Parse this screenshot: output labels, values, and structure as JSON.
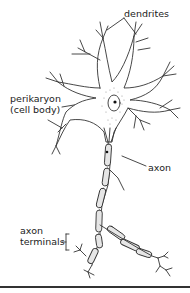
{
  "diagram": {
    "labels": {
      "dendrites": "dendrites",
      "perikaryon": "perikaryon",
      "cell_body": "(cell body)",
      "axon": "axon",
      "axon_terminals_line1": "axon",
      "axon_terminals_line2": "terminals"
    },
    "colors": {
      "stroke": "#333333",
      "fill": "#ffffff",
      "myelin": "#e6e6e6",
      "stipple": "#9a9a9a"
    }
  }
}
